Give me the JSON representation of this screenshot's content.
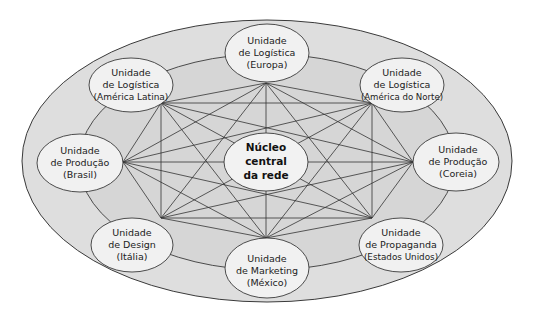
{
  "diagram": {
    "type": "network",
    "colors": {
      "outer_fill": "#dcdcdc",
      "ring_fill": "#d8d8d8",
      "node_fill": "#f1f1f1",
      "stroke": "#3a3a3a",
      "background": "#ffffff"
    },
    "core": {
      "lines": [
        "Núcleo",
        "central",
        "da rede"
      ]
    },
    "nodes": [
      {
        "id": "logistica-europa",
        "lines": [
          "Unidade",
          "de Logística",
          "(Europa)"
        ]
      },
      {
        "id": "logistica-america-do-norte",
        "lines": [
          "Unidade",
          "de Logística",
          "(América do Norte)"
        ]
      },
      {
        "id": "producao-coreia",
        "lines": [
          "Unidade",
          "de Produção",
          "(Coreia)"
        ]
      },
      {
        "id": "propaganda-estados-unidos",
        "lines": [
          "Unidade",
          "de Propaganda",
          "(Estados Unidos)"
        ]
      },
      {
        "id": "marketing-mexico",
        "lines": [
          "Unidade",
          "de Marketing",
          "(México)"
        ]
      },
      {
        "id": "design-italia",
        "lines": [
          "Unidade",
          "de Design",
          "(Itália)"
        ]
      },
      {
        "id": "producao-brasil",
        "lines": [
          "Unidade",
          "de Produção",
          "(Brasil)"
        ]
      },
      {
        "id": "logistica-america-latina",
        "lines": [
          "Unidade",
          "de Logística",
          "(América Latina)"
        ]
      }
    ],
    "edges": "fully connected mesh among all eight units, passing around the central core"
  }
}
